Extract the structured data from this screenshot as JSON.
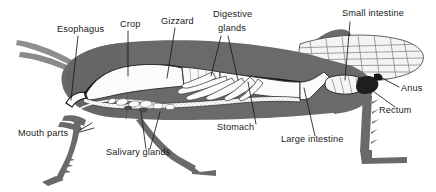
{
  "figure": {
    "view": "lateral cutaway",
    "background_color": "#ffffff",
    "body_color": "#6a6a6a",
    "body_dark_color": "#5e5e5e",
    "organ_fill_color": "#fbfbfb",
    "outline_color": "#1a1a1a",
    "wing_fill_color": "#f4f4f2",
    "label_color": "#1a1a1a"
  },
  "labels": [
    {
      "id": "esophagus",
      "text": "Esophagus",
      "x": 57,
      "y": 32,
      "anchor": "start"
    },
    {
      "id": "crop",
      "text": "Crop",
      "x": 120,
      "y": 27,
      "anchor": "start"
    },
    {
      "id": "gizzard",
      "text": "Gizzard",
      "x": 161,
      "y": 24,
      "anchor": "start"
    },
    {
      "id": "digestive",
      "text": "Digestive",
      "x": 213,
      "y": 17,
      "anchor": "start"
    },
    {
      "id": "glands",
      "text": "glands",
      "x": 218,
      "y": 31,
      "anchor": "start"
    },
    {
      "id": "small-intestine",
      "text": "Small intestine",
      "x": 342,
      "y": 16,
      "anchor": "start"
    },
    {
      "id": "anus",
      "text": "Anus",
      "x": 401,
      "y": 91,
      "anchor": "start"
    },
    {
      "id": "rectum",
      "text": "Rectum",
      "x": 379,
      "y": 113,
      "anchor": "start"
    },
    {
      "id": "large-intestine",
      "text": "Large intestine",
      "x": 281,
      "y": 142,
      "anchor": "start"
    },
    {
      "id": "stomach",
      "text": "Stomach",
      "x": 217,
      "y": 130,
      "anchor": "start"
    },
    {
      "id": "salivary-glands",
      "text": "Salivary glands",
      "x": 106,
      "y": 155,
      "anchor": "start"
    },
    {
      "id": "mouth-parts",
      "text": "Mouth parts",
      "x": 18,
      "y": 136,
      "anchor": "start"
    }
  ],
  "anatomy_parts": [
    "Esophagus",
    "Crop",
    "Gizzard",
    "Digestive glands",
    "Small intestine",
    "Anus",
    "Rectum",
    "Large intestine",
    "Stomach",
    "Salivary glands",
    "Mouth parts"
  ]
}
